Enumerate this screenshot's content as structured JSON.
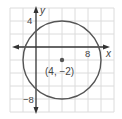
{
  "diagram": {
    "type": "coordinate-plane-circle",
    "x_axis_label": "x",
    "y_axis_label": "y",
    "tick_labels": {
      "x_positive": "8",
      "y_positive": "4",
      "y_negative": "−8"
    },
    "center_label": "(4, −2)",
    "circle": {
      "center": [
        4,
        -2
      ],
      "radius": 6
    },
    "grid_step_units": 2,
    "colors": {
      "grid": "#d9d9d9",
      "axis": "#333333",
      "circle": "#555555",
      "text": "#444444"
    }
  }
}
